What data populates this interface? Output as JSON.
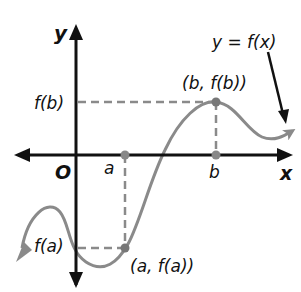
{
  "diagram": {
    "axis_labels": {
      "y": "y",
      "x": "x",
      "origin": "O"
    },
    "tick_labels": {
      "a": "a",
      "b": "b",
      "fa": "f(a)",
      "fb": "f(b)"
    },
    "point_labels": {
      "max": "(b, f(b))",
      "min": "(a, f(a))"
    },
    "curve_label": "y = f(x)",
    "colors": {
      "axes": "#111111",
      "curve": "#8a8a8a",
      "dash": "#8a8a8a",
      "points": "#777777"
    }
  }
}
